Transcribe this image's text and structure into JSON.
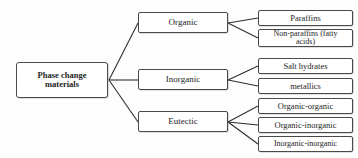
{
  "diagram": {
    "type": "hierarchy-tree",
    "root": {
      "id": "phase-change-materials",
      "label": "Phase change materials",
      "label_line1": "Phase change",
      "label_line2": "materials"
    },
    "branches": [
      {
        "id": "organic",
        "label": "Organic",
        "children": [
          {
            "id": "paraffins",
            "label": "Paraffins"
          },
          {
            "id": "non-paraffins",
            "label": "Non-paraffins (fatty acids)",
            "label_line1": "Non-paraffins (fatty",
            "label_line2": "acids)"
          }
        ]
      },
      {
        "id": "inorganic",
        "label": "Inorganic",
        "children": [
          {
            "id": "salt-hydrates",
            "label": "Salt hydrates"
          },
          {
            "id": "metallics",
            "label": "metallics"
          }
        ]
      },
      {
        "id": "eutectic",
        "label": "Eutectic",
        "children": [
          {
            "id": "organic-organic",
            "label": "Organic-organic"
          },
          {
            "id": "organic-inorganic",
            "label": "Organic-inorganic"
          },
          {
            "id": "inorganic-inorganic",
            "label": "Inorganic-inorganic"
          }
        ]
      }
    ],
    "colors": {
      "background": "#fdfdfd",
      "box_border": "#4a4a4a",
      "box_fill": "#ffffff",
      "text": "#1d1d1d",
      "connector": "#2e2e2e"
    }
  }
}
